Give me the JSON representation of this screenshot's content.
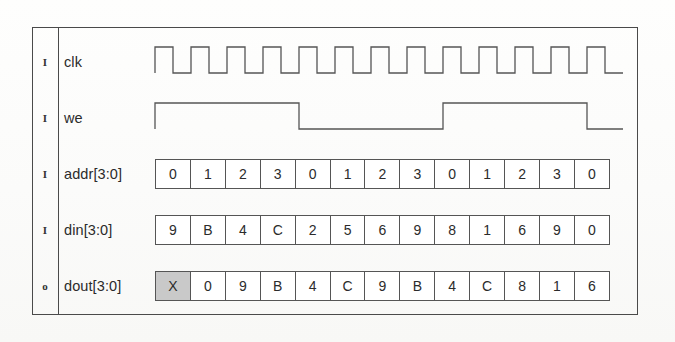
{
  "diagram": {
    "frame_color": "#4a4a4a",
    "wave_color": "#555555",
    "shaded_cell_color": "#c9c9c9",
    "cycles": 13
  },
  "signals": [
    {
      "direction": "I",
      "name": "clk",
      "type": "clock",
      "pulses": 13
    },
    {
      "direction": "I",
      "name": "we",
      "type": "binary",
      "levels": [
        1,
        1,
        1,
        1,
        0,
        0,
        0,
        0,
        1,
        1,
        1,
        1,
        0
      ]
    },
    {
      "direction": "I",
      "name": "addr[3:0]",
      "type": "bus",
      "values": [
        "0",
        "1",
        "2",
        "3",
        "0",
        "1",
        "2",
        "3",
        "0",
        "1",
        "2",
        "3",
        "0"
      ]
    },
    {
      "direction": "I",
      "name": "din[3:0]",
      "type": "bus",
      "values": [
        "9",
        "B",
        "4",
        "C",
        "2",
        "5",
        "6",
        "9",
        "8",
        "1",
        "6",
        "9",
        "0"
      ]
    },
    {
      "direction": "o",
      "name": "dout[3:0]",
      "type": "bus",
      "values": [
        "X",
        "0",
        "9",
        "B",
        "4",
        "C",
        "9",
        "B",
        "4",
        "C",
        "8",
        "1",
        "6"
      ],
      "shaded_indices": [
        0
      ]
    }
  ],
  "chart_data": {
    "type": "table",
    "xlabel": "clock cycle",
    "ylabel": "signal",
    "categories": [
      "1",
      "2",
      "3",
      "4",
      "5",
      "6",
      "7",
      "8",
      "9",
      "10",
      "11",
      "12",
      "13"
    ],
    "series": [
      {
        "name": "clk",
        "values": [
          "↑",
          "↑",
          "↑",
          "↑",
          "↑",
          "↑",
          "↑",
          "↑",
          "↑",
          "↑",
          "↑",
          "↑",
          "↑"
        ]
      },
      {
        "name": "we",
        "values": [
          1,
          1,
          1,
          1,
          0,
          0,
          0,
          0,
          1,
          1,
          1,
          1,
          0
        ]
      },
      {
        "name": "addr[3:0]",
        "values": [
          "0",
          "1",
          "2",
          "3",
          "0",
          "1",
          "2",
          "3",
          "0",
          "1",
          "2",
          "3",
          "0"
        ]
      },
      {
        "name": "din[3:0]",
        "values": [
          "9",
          "B",
          "4",
          "C",
          "2",
          "5",
          "6",
          "9",
          "8",
          "1",
          "6",
          "9",
          "0"
        ]
      },
      {
        "name": "dout[3:0]",
        "values": [
          "X",
          "0",
          "9",
          "B",
          "4",
          "C",
          "9",
          "B",
          "4",
          "C",
          "8",
          "1",
          "6"
        ]
      }
    ],
    "legend": "none",
    "grid": false
  }
}
